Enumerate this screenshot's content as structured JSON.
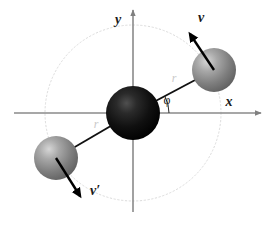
{
  "figure": {
    "background_color": "#ffffff",
    "width": 273,
    "height": 229
  },
  "axes": {
    "x": {
      "label": "x",
      "color": "#808080",
      "start": [
        14,
        113
      ],
      "end": [
        263,
        113
      ],
      "arrow": "right"
    },
    "y": {
      "label": "y",
      "color": "#808080",
      "start": [
        133,
        213
      ],
      "end": [
        133,
        8
      ],
      "arrow": "up"
    },
    "origin": [
      133,
      113
    ]
  },
  "orbit": {
    "name": "orbit-circle",
    "center": [
      133,
      113
    ],
    "radius": 88,
    "color": "#d8d8d8",
    "style": "dotted"
  },
  "particles": [
    {
      "id": "center-atom",
      "label": "",
      "center": [
        133,
        113
      ],
      "radius": 27,
      "fill": "#0a0a0a",
      "highlight": "#4a4a4a"
    },
    {
      "id": "upper-right-atom",
      "label": "",
      "center": [
        214,
        70
      ],
      "radius": 22,
      "fill": "#8c8c8c",
      "highlight": "#d0d0d0"
    },
    {
      "id": "lower-left-atom",
      "label": "",
      "center": [
        56,
        158
      ],
      "radius": 22,
      "fill": "#8c8c8c",
      "highlight": "#d0d0d0"
    }
  ],
  "bonds": [
    {
      "id": "bond-upper-right",
      "from": [
        133,
        113
      ],
      "to": [
        214,
        70
      ],
      "color": "#1a1a1a",
      "label": "r",
      "label_pos": [
        173,
        79
      ]
    },
    {
      "id": "bond-lower-left",
      "from": [
        133,
        113
      ],
      "to": [
        56,
        158
      ],
      "color": "#1a1a1a",
      "label": "r",
      "label_pos": [
        96,
        125
      ]
    }
  ],
  "vectors": [
    {
      "id": "velocity-v",
      "label": "v",
      "from": [
        214,
        70
      ],
      "to": [
        189,
        32
      ],
      "color": "#000000",
      "label_pos": [
        201,
        18
      ]
    },
    {
      "id": "velocity-v-prime",
      "label": "v′",
      "from": [
        56,
        158
      ],
      "to": [
        81,
        199
      ],
      "color": "#000000",
      "label_pos": [
        91,
        189
      ]
    }
  ],
  "angle": {
    "id": "phi-angle",
    "label": "φ",
    "vertex": [
      133,
      113
    ],
    "radius": 36,
    "start_deg": 0,
    "end_deg": 28,
    "color": "#1a1a1a",
    "label_pos": [
      167,
      103
    ]
  }
}
